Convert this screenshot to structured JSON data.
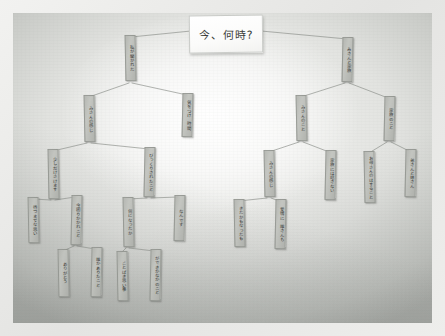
{
  "scene": {
    "medium": "photograph of a whiteboard",
    "board_color": "#e2e3e0",
    "node_color": "#b6b8b3",
    "ink_color": "#2d2f2c",
    "line_color": "#8d908b",
    "frame_color": "#efefed"
  },
  "title_card": {
    "text": "今、何時?",
    "x": 176,
    "y": 2,
    "w": 72,
    "h": 36
  },
  "tree": {
    "root_label": "今、何時?",
    "nodes": [
      {
        "id": "L0",
        "text": "私が聞かれた",
        "x": 112,
        "y": 22,
        "w": 11,
        "h": 46,
        "tilt": "tilt-l"
      },
      {
        "id": "R0",
        "text": "みさんと家族",
        "x": 329,
        "y": 24,
        "w": 11,
        "h": 45,
        "tilt": "tilt-r"
      },
      {
        "id": "L1",
        "text": "みさんの感じ",
        "x": 71,
        "y": 82,
        "w": 11,
        "h": 47,
        "tilt": "tilt-l"
      },
      {
        "id": "L2",
        "text": "気をつけ　時間",
        "x": 169,
        "y": 80,
        "w": 11,
        "h": 44,
        "tilt": "tilt-r"
      },
      {
        "id": "R1",
        "text": "みさんのこと",
        "x": 283,
        "y": 82,
        "w": 11,
        "h": 46,
        "tilt": "tilt-l"
      },
      {
        "id": "R2",
        "text": "家族のこと",
        "x": 371,
        "y": 83,
        "w": 11,
        "h": 45,
        "tilt": "tilt-r"
      },
      {
        "id": "L1a",
        "text": "少しだけさけます",
        "x": 35,
        "y": 136,
        "w": 11,
        "h": 50,
        "tilt": "tilt-l"
      },
      {
        "id": "L1b",
        "text": "びっくりされたこと",
        "x": 131,
        "y": 134,
        "w": 11,
        "h": 50,
        "tilt": "tilt-r"
      },
      {
        "id": "R1a",
        "text": "みさんの感じ",
        "x": 251,
        "y": 137,
        "w": 11,
        "h": 47,
        "tilt": "tilt-l"
      },
      {
        "id": "R1b",
        "text": "家族には話さない",
        "x": 312,
        "y": 137,
        "w": 11,
        "h": 50,
        "tilt": "tilt-r"
      },
      {
        "id": "R2a",
        "text": "お母さんのはすること",
        "x": 351,
        "y": 138,
        "w": 11,
        "h": 52,
        "tilt": "tilt-l"
      },
      {
        "id": "R2b",
        "text": "弟さんと妹さん",
        "x": 392,
        "y": 136,
        "w": 11,
        "h": 48,
        "tilt": "tilt-r"
      },
      {
        "id": "L1a1",
        "text": "待つまでな思い",
        "x": 15,
        "y": 184,
        "w": 11,
        "h": 46,
        "tilt": "tilt-l"
      },
      {
        "id": "L1a2",
        "text": "今困りかかれこと",
        "x": 58,
        "y": 182,
        "w": 11,
        "h": 50,
        "tilt": "tilt-r"
      },
      {
        "id": "L1b1",
        "text": "何になったか",
        "x": 110,
        "y": 184,
        "w": 11,
        "h": 50,
        "tilt": "tilt-l"
      },
      {
        "id": "L1b2",
        "text": "なんです",
        "x": 161,
        "y": 182,
        "w": 11,
        "h": 46,
        "tilt": "tilt-r"
      },
      {
        "id": "R1a1",
        "text": "きたかもなったも",
        "x": 221,
        "y": 186,
        "w": 11,
        "h": 48,
        "tilt": "tilt-l"
      },
      {
        "id": "R1a2",
        "text": "愛情に　誰さんも",
        "x": 262,
        "y": 186,
        "w": 11,
        "h": 50,
        "tilt": "tilt-r"
      },
      {
        "id": "L1a2a",
        "text": "ありがとう",
        "x": 45,
        "y": 236,
        "w": 11,
        "h": 48,
        "tilt": "tilt-l"
      },
      {
        "id": "L1a2b",
        "text": "誰かありたこと",
        "x": 78,
        "y": 234,
        "w": 11,
        "h": 50,
        "tilt": "tilt-r"
      },
      {
        "id": "L1b1a",
        "text": "ことばき思い事",
        "x": 104,
        "y": 238,
        "w": 11,
        "h": 50,
        "tilt": "tilt-l"
      },
      {
        "id": "L1b1b",
        "text": "ができかなかのこと",
        "x": 137,
        "y": 236,
        "w": 11,
        "h": 52,
        "tilt": "tilt-r"
      }
    ],
    "edges": [
      {
        "from": "title",
        "to": "L0",
        "x1": 178,
        "y1": 18,
        "x2": 118,
        "y2": 24
      },
      {
        "from": "title",
        "to": "R0",
        "x1": 248,
        "y1": 18,
        "x2": 334,
        "y2": 26
      },
      {
        "from": "L0",
        "to": "L1",
        "x1": 116,
        "y1": 70,
        "x2": 76,
        "y2": 84
      },
      {
        "from": "L0",
        "to": "L2",
        "x1": 119,
        "y1": 70,
        "x2": 174,
        "y2": 82
      },
      {
        "from": "R0",
        "to": "R1",
        "x1": 332,
        "y1": 70,
        "x2": 288,
        "y2": 84
      },
      {
        "from": "R0",
        "to": "R2",
        "x1": 336,
        "y1": 70,
        "x2": 375,
        "y2": 85
      },
      {
        "from": "L1",
        "to": "L1a",
        "x1": 74,
        "y1": 130,
        "x2": 40,
        "y2": 138
      },
      {
        "from": "L1",
        "to": "L1b",
        "x1": 78,
        "y1": 130,
        "x2": 136,
        "y2": 136
      },
      {
        "from": "R1",
        "to": "R1a",
        "x1": 286,
        "y1": 129,
        "x2": 256,
        "y2": 139
      },
      {
        "from": "R1",
        "to": "R1b",
        "x1": 290,
        "y1": 129,
        "x2": 316,
        "y2": 139
      },
      {
        "from": "R2",
        "to": "R2a",
        "x1": 374,
        "y1": 129,
        "x2": 356,
        "y2": 140
      },
      {
        "from": "R2",
        "to": "R2b",
        "x1": 378,
        "y1": 129,
        "x2": 396,
        "y2": 138
      },
      {
        "from": "L1a",
        "to": "L1a1",
        "x1": 38,
        "y1": 187,
        "x2": 20,
        "y2": 186
      },
      {
        "from": "L1a",
        "to": "L1a2",
        "x1": 42,
        "y1": 187,
        "x2": 62,
        "y2": 184
      },
      {
        "from": "L1b",
        "to": "L1b1",
        "x1": 134,
        "y1": 185,
        "x2": 115,
        "y2": 186
      },
      {
        "from": "L1b",
        "to": "L1b2",
        "x1": 138,
        "y1": 185,
        "x2": 165,
        "y2": 184
      },
      {
        "from": "R1a",
        "to": "R1a1",
        "x1": 254,
        "y1": 185,
        "x2": 226,
        "y2": 188
      },
      {
        "from": "R1a",
        "to": "R1a2",
        "x1": 258,
        "y1": 185,
        "x2": 266,
        "y2": 188
      },
      {
        "from": "L1a2",
        "to": "L1a2a",
        "x1": 61,
        "y1": 233,
        "x2": 50,
        "y2": 238
      },
      {
        "from": "L1a2",
        "to": "L1a2b",
        "x1": 64,
        "y1": 233,
        "x2": 82,
        "y2": 236
      },
      {
        "from": "L1b1",
        "to": "L1b1a",
        "x1": 113,
        "y1": 235,
        "x2": 108,
        "y2": 240
      },
      {
        "from": "L1b1",
        "to": "L1b1b",
        "x1": 116,
        "y1": 235,
        "x2": 141,
        "y2": 238
      }
    ]
  }
}
